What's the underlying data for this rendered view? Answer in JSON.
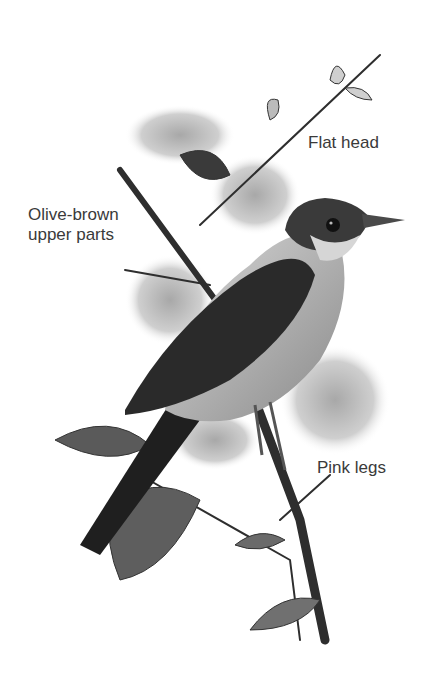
{
  "figure": {
    "labels": [
      {
        "id": "flat-head",
        "text": "Flat head"
      },
      {
        "id": "olive-brown-upper-parts",
        "lines": [
          "Olive-brown",
          "upper parts"
        ]
      },
      {
        "id": "pink-legs",
        "text": "Pink legs"
      }
    ]
  },
  "colors": {
    "background": "#ffffff",
    "label_text": "#3a3a3a",
    "bird_dark": "#2a2a2a",
    "bird_mid": "#6e6e6e",
    "bird_light": "#c8c8c8",
    "flowers": "#bdbdbd"
  }
}
